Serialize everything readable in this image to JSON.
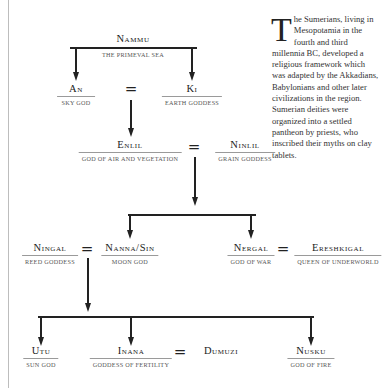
{
  "diagram": {
    "nodes": {
      "nammu": {
        "name": "Nammu",
        "desc": "The Primeval Sea"
      },
      "an": {
        "name": "An",
        "desc": "Sky God"
      },
      "ki": {
        "name": "Ki",
        "desc": "Earth Goddess"
      },
      "enlil": {
        "name": "Enlil",
        "desc": "God of Air and Vegetation"
      },
      "ninlil": {
        "name": "Ninlil",
        "desc": "Grain Goddess"
      },
      "ningal": {
        "name": "Ningal",
        "desc": "Reed Goddess"
      },
      "nanna": {
        "name": "Nanna/Sin",
        "desc": "Moon God"
      },
      "nergal": {
        "name": "Nergal",
        "desc": "God of War"
      },
      "ereshkigal": {
        "name": "Ereshkigal",
        "desc": "Queen of Underworld"
      },
      "utu": {
        "name": "Utu",
        "desc": "Sun God"
      },
      "inana": {
        "name": "Inana",
        "desc": "Goddess of Fertility"
      },
      "dumuzi": {
        "name": "Dumuzi"
      },
      "nusku": {
        "name": "Nusku",
        "desc": "God of Fire"
      }
    },
    "marriage_symbol": "="
  },
  "sidebar_text": {
    "dropcap": "T",
    "body": "he Sumerians, living in Mesopotamia in the fourth and third millennia BC, developed a religious framework which was adapted by the Akkadians, Babylonians and other later civilizations in the region. Sumerian deities were organized into a settled pantheon by priests, who inscribed their myths on clay tablets."
  }
}
